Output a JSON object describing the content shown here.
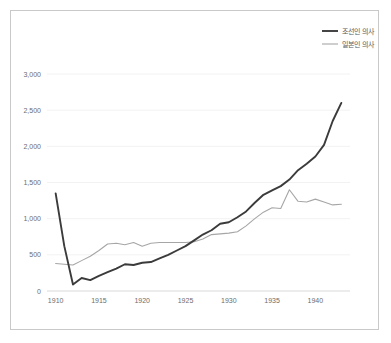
{
  "chart_data": {
    "type": "line",
    "title": "",
    "xlabel": "",
    "ylabel": "",
    "xlim": [
      1909,
      1944
    ],
    "ylim": [
      0,
      3000
    ],
    "grid": true,
    "legend_position": "top-right",
    "y_ticks": [
      "0",
      "500",
      "1,000",
      "1,500",
      "2,000",
      "2,500",
      "3,000"
    ],
    "y_tick_values": [
      0,
      500,
      1000,
      1500,
      2000,
      2500,
      3000
    ],
    "x_ticks": [
      "1910",
      "1915",
      "1920",
      "1925",
      "1930",
      "1935",
      "1940"
    ],
    "x_tick_values": [
      1910,
      1915,
      1920,
      1925,
      1930,
      1935,
      1940
    ],
    "x": [
      1910,
      1911,
      1912,
      1913,
      1914,
      1915,
      1916,
      1917,
      1918,
      1919,
      1920,
      1921,
      1922,
      1923,
      1924,
      1925,
      1926,
      1927,
      1928,
      1929,
      1930,
      1931,
      1932,
      1933,
      1934,
      1935,
      1936,
      1937,
      1938,
      1939,
      1940,
      1941,
      1942,
      1943
    ],
    "series": [
      {
        "name": "조선인 의사",
        "color": "#3b3b3b",
        "values": [
          1350,
          620,
          90,
          180,
          150,
          210,
          260,
          310,
          370,
          360,
          390,
          400,
          450,
          500,
          560,
          620,
          700,
          780,
          840,
          930,
          950,
          1020,
          1100,
          1220,
          1330,
          1390,
          1450,
          1540,
          1670,
          1760,
          1860,
          2020,
          2350,
          2600
        ]
      },
      {
        "name": "일본인 의사",
        "color": "#a6a6a6",
        "values": [
          380,
          370,
          360,
          420,
          480,
          560,
          650,
          660,
          640,
          670,
          620,
          660,
          670,
          670,
          670,
          670,
          680,
          720,
          780,
          790,
          800,
          820,
          900,
          1000,
          1090,
          1150,
          1140,
          1400,
          1240,
          1230,
          1270,
          1230,
          1190,
          1200
        ]
      }
    ]
  },
  "legend": {
    "items": [
      {
        "label": "조선인 의사"
      },
      {
        "label": "일본인 의사"
      }
    ]
  }
}
